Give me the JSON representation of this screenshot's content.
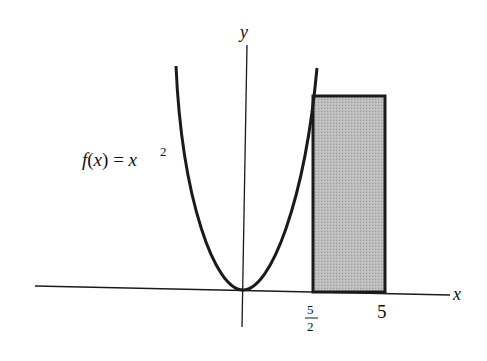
{
  "diagram": {
    "function_label": "f(x) = x",
    "function_label_parts": {
      "fx": "f",
      "open": "(",
      "x": "x",
      "close": ")",
      "eq": " = ",
      "base": "x",
      "exp": "2"
    },
    "axes": {
      "x_label": "x",
      "y_label": "y"
    },
    "ticks": [
      {
        "label_numerator": "5",
        "label_denominator": "2",
        "value": 2.5
      },
      {
        "label": "5",
        "value": 5
      }
    ],
    "rectangle": {
      "x_from": 2.5,
      "x_to": 5,
      "height": "f(5/2)",
      "fill": "#b8b8b8"
    },
    "curve": {
      "expression": "x^2",
      "stroke": "#1a1a1a"
    },
    "colors": {
      "ink": "#1a1a1a",
      "shade": "#b8b8b8",
      "background": "#ffffff"
    }
  }
}
